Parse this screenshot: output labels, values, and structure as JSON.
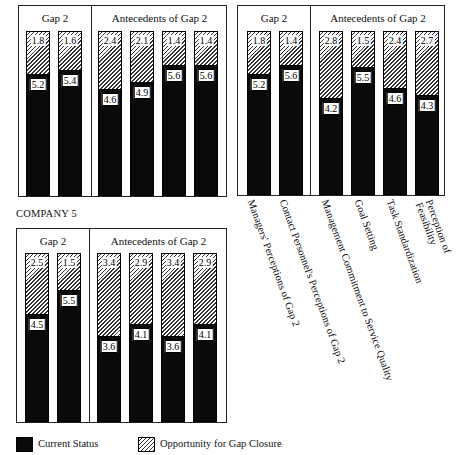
{
  "chart_data": [
    {
      "type": "bar",
      "stacked": true,
      "title": "",
      "panel_position": "top-left",
      "group_headers": [
        "Gap 2",
        "Antecedents of Gap 2"
      ],
      "categories": [
        "Managers' Perceptions of Gap 2",
        "Contact Personnel's Perceptions of Gap 2",
        "Management Commitment to Service Quality",
        "Goal Setting",
        "Task Standardization",
        "Perception of Feasibility"
      ],
      "series": [
        {
          "name": "Current Status",
          "values": [
            5.2,
            5.4,
            4.6,
            4.9,
            5.6,
            5.6
          ]
        },
        {
          "name": "Opportunity for Gap Closure",
          "values": [
            1.8,
            1.6,
            2.4,
            2.1,
            1.4,
            1.4
          ]
        }
      ],
      "ylim": [
        0,
        7
      ]
    },
    {
      "type": "bar",
      "stacked": true,
      "title": "",
      "panel_position": "top-right",
      "group_headers": [
        "Gap 2",
        "Antecedents of Gap 2"
      ],
      "categories": [
        "Managers' Perceptions of Gap 2",
        "Contact Personnel's Perceptions of Gap 2",
        "Management Commitment to Service Quality",
        "Goal Setting",
        "Task Standardization",
        "Perception of Feasibility"
      ],
      "series": [
        {
          "name": "Current Status",
          "values": [
            5.2,
            5.6,
            4.2,
            5.5,
            4.6,
            4.3
          ]
        },
        {
          "name": "Opportunity for Gap Closure",
          "values": [
            1.8,
            1.4,
            2.8,
            1.5,
            2.4,
            2.7
          ]
        }
      ],
      "ylim": [
        0,
        7
      ]
    },
    {
      "type": "bar",
      "stacked": true,
      "title": "COMPANY 5",
      "panel_position": "bottom-left",
      "group_headers": [
        "Gap 2",
        "Antecedents of Gap 2"
      ],
      "categories": [
        "Managers' Perceptions of Gap 2",
        "Contact Personnel's Perceptions of Gap 2",
        "Management Commitment to Service Quality",
        "Goal Setting",
        "Task Standardization",
        "Perception of Feasibility"
      ],
      "series": [
        {
          "name": "Current Status",
          "values": [
            4.5,
            5.5,
            3.6,
            4.1,
            3.6,
            4.1
          ]
        },
        {
          "name": "Opportunity for Gap Closure",
          "values": [
            2.5,
            1.5,
            3.4,
            2.9,
            3.4,
            2.9
          ]
        }
      ],
      "ylim": [
        0,
        7
      ]
    }
  ],
  "labels": {
    "gap2": "Gap 2",
    "antecedents": "Antecedents of Gap 2",
    "company5": "COMPANY 5",
    "categories": [
      "Managers' Perceptions of Gap 2",
      "Contact Personnel's Perceptions of Gap 2",
      "Management Commitment to Service Quality",
      "Goal Setting",
      "Task Standardization",
      "Perception of",
      "Feasibility"
    ]
  },
  "legend": {
    "current": "Current Status",
    "opportunity": "Opportunity for Gap Closure"
  }
}
